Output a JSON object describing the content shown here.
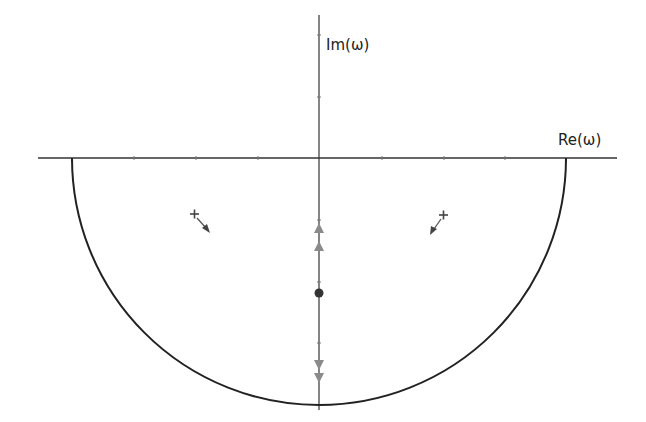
{
  "diagram": {
    "type": "complex-plane contour",
    "axes": {
      "x_label": "Re(ω)",
      "y_label": "Im(ω)"
    },
    "contour": {
      "shape": "lower semicircle closed along real axis",
      "color": "#222222"
    },
    "markers": {
      "poles": [
        {
          "symbol": "+",
          "side": "left",
          "arrow": "down-right"
        },
        {
          "symbol": "+",
          "side": "right",
          "arrow": "down-left"
        }
      ],
      "point": {
        "symbol": "●",
        "position": "negative imaginary axis"
      },
      "imag_axis_arrows": {
        "up": 2,
        "down": 2,
        "color": "#8a8a8a"
      }
    }
  }
}
